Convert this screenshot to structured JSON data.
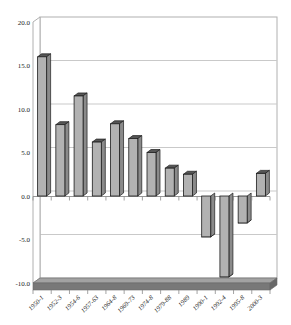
{
  "chart_data": {
    "type": "bar",
    "style": "3d-column-grayscale",
    "title": "",
    "xlabel": "",
    "ylabel": "",
    "categories": [
      "1950-1",
      "1952-3",
      "1954-6",
      "1957-63",
      "1964-8",
      "1969-73",
      "1974-8",
      "1979-88",
      "1989",
      "1990-1",
      "1992-4",
      "1995-8",
      "2000-3"
    ],
    "values": [
      16.0,
      8.2,
      11.5,
      6.2,
      8.3,
      6.6,
      5.0,
      3.2,
      2.5,
      -4.7,
      -9.3,
      -3.1,
      2.6
    ],
    "ylim": [
      -10,
      20
    ],
    "ytick_interval": 5,
    "ytick_labels": [
      "20.0",
      "15.0",
      "10.0",
      "5.0",
      "0.0",
      "-5.0",
      "-10.0"
    ],
    "grid": true,
    "legend": false,
    "colors": {
      "background": "#ffffff",
      "bar_front": "#b2b2b2",
      "bar_side": "#8a8a8a",
      "bar_cap": "#565656",
      "bar_outline": "#1c1c1c",
      "gridline": "#c9c9c9",
      "wall_border": "#b0b0b0",
      "wall_fill": "#ffffff",
      "floor_top": "#a2a2a2",
      "floor_front": "#787878",
      "floor_side": "#686868",
      "axis_line": "#8c8c8c",
      "tick_color": "#8c8c8c",
      "label_color": "#222222"
    }
  }
}
